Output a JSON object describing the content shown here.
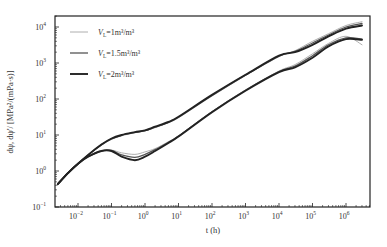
{
  "chart_data": {
    "type": "line",
    "title": "",
    "xlabel": "t (h)",
    "ylabel": "dψ, dψ'/ [MPa²/(mPa·s)]",
    "xscale": "log",
    "yscale": "log",
    "xlim": [
      0.002,
      5000000
    ],
    "ylim": [
      0.1,
      20000
    ],
    "x_ticks": [
      "10^-2",
      "10^-1",
      "10^0",
      "10^1",
      "10^2",
      "10^3",
      "10^4",
      "10^5",
      "10^6"
    ],
    "y_ticks": [
      "10^-1",
      "10^0",
      "10^1",
      "10^2",
      "10^3",
      "10^4"
    ],
    "grid": false,
    "legend_position": "upper left",
    "legend": [
      {
        "label": "V_L=1m³/m³",
        "color": "#9a9a9a",
        "width": 0.8
      },
      {
        "label": "V_L=1.5m³/m³",
        "color": "#555555",
        "width": 1.3
      },
      {
        "label": "V_L=2m³/m³",
        "color": "#222222",
        "width": 1.9
      }
    ],
    "x": [
      0.0025,
      0.005,
      0.01,
      0.02,
      0.05,
      0.1,
      0.2,
      0.5,
      1,
      2,
      5,
      10,
      100,
      1000,
      10000,
      30000,
      100000,
      300000,
      1000000,
      3000000
    ],
    "series": [
      {
        "name": "pressure V_L=1",
        "group": "V_L=1m³/m³",
        "values": [
          0.45,
          0.9,
          1.6,
          2.8,
          5.2,
          7.5,
          9.5,
          11.5,
          13,
          16,
          22,
          30,
          120,
          450,
          1500,
          2200,
          4000,
          6500,
          11000,
          14000
        ]
      },
      {
        "name": "pressure V_L=1.5",
        "group": "V_L=1.5m³/m³",
        "values": [
          0.44,
          0.88,
          1.6,
          2.8,
          5.3,
          7.8,
          9.8,
          11.8,
          13.2,
          16.5,
          22.5,
          31,
          125,
          460,
          1550,
          2100,
          3600,
          6000,
          10000,
          12500
        ]
      },
      {
        "name": "pressure V_L=2",
        "group": "V_L=2m³/m³",
        "values": [
          0.43,
          0.87,
          1.6,
          2.8,
          5.4,
          8,
          10,
          12,
          13.5,
          17,
          23,
          32,
          130,
          470,
          1600,
          2000,
          3200,
          5500,
          9000,
          11000
        ]
      },
      {
        "name": "derivative V_L=1",
        "group": "V_L=1m³/m³",
        "values": [
          0.45,
          0.9,
          1.6,
          2.5,
          3.6,
          3.8,
          3.2,
          2.9,
          3.4,
          4.2,
          6.5,
          9.5,
          45,
          180,
          600,
          900,
          1800,
          3500,
          5500,
          3200
        ]
      },
      {
        "name": "derivative V_L=1.5",
        "group": "V_L=1.5m³/m³",
        "values": [
          0.44,
          0.88,
          1.6,
          2.5,
          3.6,
          3.7,
          2.8,
          2.4,
          2.9,
          3.9,
          6.3,
          9.3,
          44,
          175,
          580,
          820,
          1600,
          3200,
          5000,
          4600
        ]
      },
      {
        "name": "derivative V_L=2",
        "group": "V_L=2m³/m³",
        "values": [
          0.43,
          0.87,
          1.6,
          2.5,
          3.6,
          3.6,
          2.5,
          2.0,
          2.5,
          3.6,
          6.0,
          9.0,
          43,
          170,
          560,
          760,
          1400,
          2900,
          4600,
          4400
        ]
      }
    ]
  },
  "plot_area": {
    "left": 55,
    "right": 370,
    "top": 16,
    "bottom": 207
  },
  "axes": {
    "xlabel_text": "t (h)",
    "ylabel_text": "dψ, dψ'/ [MPa²/(mPa·s)]"
  }
}
